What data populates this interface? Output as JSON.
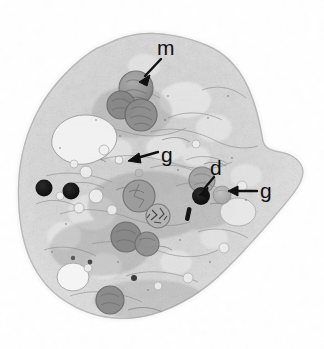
{
  "figure": {
    "kind": "transmission-electron-micrograph",
    "width": 324,
    "height": 349,
    "background_color": "#ffffff",
    "ink_color": "#101010"
  },
  "labels": [
    {
      "id": "m",
      "text": "m",
      "x": 157,
      "y": 37,
      "meaning": "mitochondrion",
      "arrow": {
        "x1": 160,
        "y1": 60,
        "x2": 141,
        "y2": 80
      }
    },
    {
      "id": "g1",
      "text": "g",
      "x": 161,
      "y": 144,
      "meaning": "granule",
      "arrow": {
        "x1": 157,
        "y1": 153,
        "x2": 129,
        "y2": 160
      }
    },
    {
      "id": "d",
      "text": "d",
      "x": 210,
      "y": 157,
      "meaning": "dense body",
      "arrow": {
        "x1": 212,
        "y1": 176,
        "x2": 201,
        "y2": 193
      }
    },
    {
      "id": "g2",
      "text": "g",
      "x": 260,
      "y": 180,
      "meaning": "granule",
      "arrow": {
        "x1": 256,
        "y1": 190,
        "x2": 228,
        "y2": 192
      }
    }
  ],
  "cell": {
    "outline_points": "112,41 148,33 186,36 216,49 236,66 252,92 262,120 268,146 282,152 299,160 303,176 292,196 272,222 246,252 214,284 180,306 146,316 112,316 84,310 58,296 38,276 26,250 20,220 18,188 24,154 38,120 60,86 86,58",
    "fill_color": "#dcdcdc",
    "edge_color": "#b8b8b8"
  },
  "organelles": {
    "mitochondria": [
      {
        "name": "mitochondrion-upper-1",
        "cx": 136,
        "cy": 88,
        "r": 17,
        "tone": "#9a9a9a"
      },
      {
        "name": "mitochondrion-upper-2",
        "cx": 122,
        "cy": 104,
        "r": 14,
        "tone": "#8e8e8e"
      },
      {
        "name": "mitochondrion-upper-3",
        "cx": 141,
        "cy": 114,
        "r": 16,
        "tone": "#929292"
      },
      {
        "name": "mitochondrion-mid",
        "cx": 139,
        "cy": 196,
        "r": 16,
        "tone": "#9c9c9c"
      },
      {
        "name": "mitochondrion-lower-1",
        "cx": 127,
        "cy": 236,
        "r": 15,
        "tone": "#8a8a8a"
      },
      {
        "name": "mitochondrion-lower-2",
        "cx": 147,
        "cy": 243,
        "r": 12,
        "tone": "#909090"
      },
      {
        "name": "mitochondrion-bottom",
        "cx": 110,
        "cy": 300,
        "r": 14,
        "tone": "#8d8d8d"
      },
      {
        "name": "mitochondrion-right",
        "cx": 202,
        "cy": 180,
        "r": 13,
        "tone": "#9e9e9e"
      }
    ],
    "dense_bodies": [
      {
        "name": "dense-body-left-1",
        "cx": 44,
        "cy": 188,
        "r": 8,
        "tone": "#1a1a1a"
      },
      {
        "name": "dense-body-left-2",
        "cx": 71,
        "cy": 191,
        "r": 8,
        "tone": "#1c1c1c"
      },
      {
        "name": "dense-body-labeled",
        "cx": 201,
        "cy": 196,
        "r": 9,
        "tone": "#121212"
      },
      {
        "name": "dense-body-small",
        "cx": 134,
        "cy": 278,
        "r": 3,
        "tone": "#3a3a3a"
      }
    ],
    "granules": [
      {
        "name": "granule-labeled-right",
        "cx": 222,
        "cy": 194,
        "r": 9,
        "tone": "#b0b0b0"
      },
      {
        "name": "granule-center",
        "cx": 158,
        "cy": 216,
        "r": 11,
        "tone": "#a6a6a6"
      },
      {
        "name": "granule-small-left",
        "cx": 139,
        "cy": 173,
        "r": 4,
        "tone": "#bdbdbd"
      }
    ],
    "vacuoles": [
      {
        "name": "vacuole-upper-left",
        "cx": 76,
        "cy": 140,
        "rx": 30,
        "ry": 22,
        "tone": "#f0f0f0"
      },
      {
        "name": "vacuole-lower-left",
        "cx": 73,
        "cy": 277,
        "rx": 15,
        "ry": 13,
        "tone": "#f2f2f2"
      },
      {
        "name": "vacuole-right",
        "cx": 237,
        "cy": 212,
        "rx": 17,
        "ry": 13,
        "tone": "#e8e8e8"
      }
    ],
    "rod": {
      "name": "electron-dense-rod",
      "cx": 188,
      "cy": 214,
      "angle": -70,
      "length": 13,
      "tone": "#151515"
    }
  }
}
